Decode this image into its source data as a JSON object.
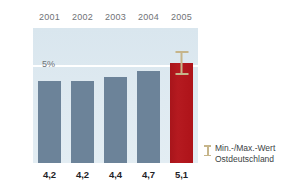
{
  "chart_data": {
    "type": "bar",
    "title": "",
    "subtitle": "",
    "xlabel": "",
    "ylabel": "",
    "categories": [
      "2001",
      "2002",
      "2003",
      "2004",
      "2005"
    ],
    "values": [
      4.2,
      4.2,
      4.4,
      4.7,
      5.1
    ],
    "value_labels": [
      "4,2",
      "4,2",
      "4,4",
      "4,7",
      "5,1"
    ],
    "ylim": [
      0,
      6.9
    ],
    "yticks": [
      0,
      5
    ],
    "ytick_labels": [
      "0%",
      "5%"
    ],
    "grid": true,
    "grid_color": "#ffffff",
    "legend_position": "right",
    "bar_colors": [
      "#6c8399",
      "#6c8399",
      "#6c8399",
      "#6c8399",
      "#b0181e"
    ],
    "accent_index": 4,
    "plot_background": "#dbe7ef",
    "error_bars": [
      {
        "category": "2005",
        "value": 5.1,
        "min": 4.5,
        "max": 5.7,
        "color": "#c6b58a"
      }
    ],
    "legend": [
      {
        "icon": "error-bar-icon",
        "line1": "Min.-/Max.-Wert",
        "line2": "Ostdeutschland",
        "color": "#c6b58a"
      }
    ]
  },
  "axis": {
    "y_tick_zero": "0%",
    "y_tick_five": "5%"
  },
  "legend": {
    "line1": "Min.-/Max.-Wert",
    "line2": "Ostdeutschland"
  }
}
